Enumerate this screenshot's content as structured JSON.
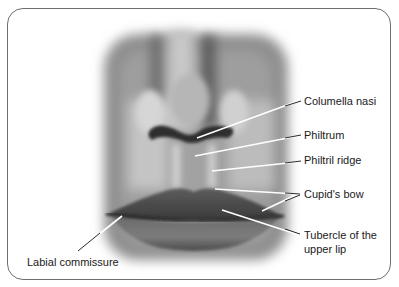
{
  "figure": {
    "labels": [
      {
        "id": "columella-nasi",
        "text": "Columella nasi"
      },
      {
        "id": "philtrum",
        "text": "Philtrum"
      },
      {
        "id": "philtril-ridge",
        "text": "Philtril ridge"
      },
      {
        "id": "cupids-bow",
        "text": "Cupid's bow"
      },
      {
        "id": "tubercle-upper-lip",
        "text": "Tubercle of the upper lip",
        "line1": "Tubercle of the",
        "line2": "upper lip"
      },
      {
        "id": "labial-commissure",
        "text": "Labial commissure"
      }
    ]
  }
}
